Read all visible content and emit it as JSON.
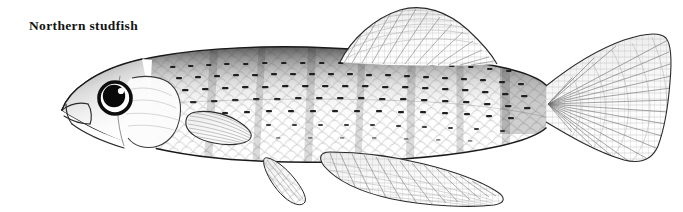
{
  "page": {
    "background_color": "#ffffff",
    "width": 683,
    "height": 212
  },
  "caption": {
    "text": "Northern studfish",
    "color": "#141414",
    "style": "bold-serif"
  },
  "illustration": {
    "subject": "Northern studfish",
    "medium": "pen-and-ink stipple line drawing",
    "orientation": "left-facing lateral view",
    "ink_color": "#1a1a1a",
    "tone_color": "#6d6d6d",
    "light_tone_color": "#b8b8b8",
    "parts": [
      {
        "name": "head",
        "label": "head"
      },
      {
        "name": "eye",
        "label": "eye"
      },
      {
        "name": "pupil",
        "label": "pupil"
      },
      {
        "name": "eye-highlight",
        "label": "eye highlight"
      },
      {
        "name": "mouth",
        "label": "upturned mouth"
      },
      {
        "name": "opercle",
        "label": "gill cover"
      },
      {
        "name": "body",
        "label": "body"
      },
      {
        "name": "scales",
        "label": "scale rows"
      },
      {
        "name": "dorsal-fin",
        "label": "dorsal fin"
      },
      {
        "name": "caudal-fin",
        "label": "caudal fin"
      },
      {
        "name": "anal-fin",
        "label": "anal fin"
      },
      {
        "name": "pelvic-fin",
        "label": "pelvic fin"
      },
      {
        "name": "pectoral-fin",
        "label": "pectoral fin"
      },
      {
        "name": "caudal-peduncle",
        "label": "caudal peduncle"
      }
    ]
  }
}
